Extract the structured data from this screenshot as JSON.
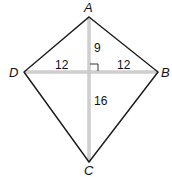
{
  "diagram": {
    "type": "kite",
    "vertices": {
      "A": {
        "label": "A"
      },
      "B": {
        "label": "B"
      },
      "C": {
        "label": "C"
      },
      "D": {
        "label": "D"
      }
    },
    "segments": {
      "DO": "12",
      "OB": "12",
      "AO": "9",
      "OC": "16"
    },
    "right_angle": true,
    "colors": {
      "outline": "#1a1a1a",
      "diagonal": "#b0b0b0"
    }
  }
}
